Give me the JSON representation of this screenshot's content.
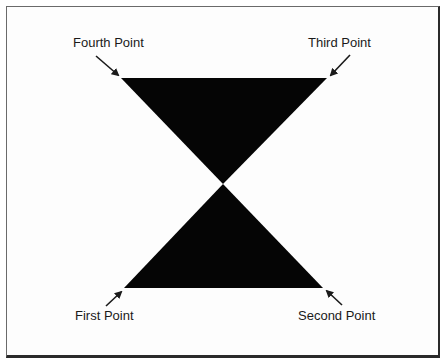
{
  "diagram": {
    "title": "",
    "shape": "bowtie",
    "fill_color": "#050505",
    "border_color": "#2a2a2a",
    "points": {
      "first": {
        "label": "First Point",
        "x": 124,
        "y": 288
      },
      "second": {
        "label": "Second Point",
        "x": 323,
        "y": 288
      },
      "third": {
        "label": "Third Point",
        "x": 327,
        "y": 78
      },
      "fourth": {
        "label": "Fourth Point",
        "x": 121,
        "y": 78
      }
    },
    "center": {
      "x": 223,
      "y": 184
    }
  }
}
